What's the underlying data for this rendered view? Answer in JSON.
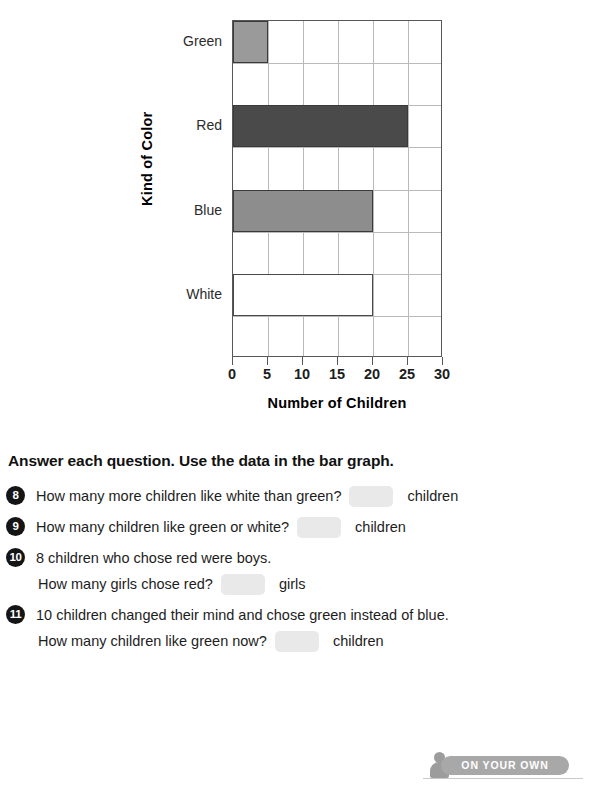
{
  "chart_data": {
    "type": "bar",
    "orientation": "horizontal",
    "title": "",
    "xlabel": "Number of Children",
    "ylabel": "Kind of Color",
    "categories": [
      "Green",
      "Red",
      "Blue",
      "White"
    ],
    "values": [
      5,
      25,
      20,
      20
    ],
    "xlim": [
      0,
      30
    ],
    "xticks": [
      0,
      5,
      10,
      15,
      20,
      25,
      30
    ],
    "grid": true,
    "legend": "none",
    "bar_styles": [
      {
        "category": "Green",
        "fill": "#9a9a9a",
        "outline": "#3a3a3a"
      },
      {
        "category": "Red",
        "fill": "#4a4a4a",
        "outline": "#3a3a3a"
      },
      {
        "category": "Blue",
        "fill": "#8d8d8d",
        "outline": "#3a3a3a"
      },
      {
        "category": "White",
        "fill": "#ffffff",
        "outline": "#4a4a4a"
      }
    ]
  },
  "directions": {
    "text": "Answer each question. Use the data in the bar graph."
  },
  "questions": [
    {
      "number": "8",
      "lines": [
        {
          "text": "How many more children like white than green?",
          "blank": true,
          "blank_value": "",
          "unit": "children"
        }
      ]
    },
    {
      "number": "9",
      "lines": [
        {
          "text": "How many children like green or white?",
          "blank": true,
          "blank_value": "",
          "unit": "children"
        }
      ]
    },
    {
      "number": "10",
      "lines": [
        {
          "text": "8 children who chose red were boys.",
          "blank": false,
          "blank_value": "",
          "unit": ""
        },
        {
          "text": "How many girls chose red?",
          "blank": true,
          "blank_value": "",
          "unit": "girls"
        }
      ]
    },
    {
      "number": "11",
      "lines": [
        {
          "text": "10 children changed their mind and chose green instead of blue.",
          "blank": false,
          "blank_value": "",
          "unit": ""
        },
        {
          "text": "How many children like green now?",
          "blank": true,
          "blank_value": "",
          "unit": "children"
        }
      ]
    }
  ],
  "footer": {
    "badge_label": "ON YOUR OWN",
    "badge_icon": "person-icon",
    "badge_color": "#a8a8a8"
  }
}
